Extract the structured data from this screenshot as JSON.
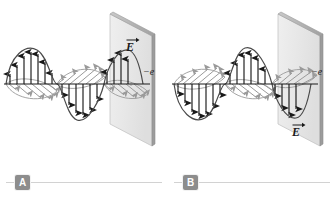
{
  "figure": {
    "background_color": "#ffffff",
    "width": 336,
    "height": 198
  },
  "colors": {
    "e_field_arrow": "#1a1a1a",
    "b_field_arrow": "#9a9a9a",
    "wave_envelope": "#4a4a4a",
    "axis": "#1a1a1a",
    "plate_face": "#e6e6e6",
    "plate_edge": "#a8a8a8",
    "plate_thickness": "#9c9c9c",
    "badge_bg": "#8d8d8d",
    "badge_text": "#ffffff",
    "caption_rule": "#d2d2d2"
  },
  "panels": [
    {
      "id": "A",
      "badge_label": "A",
      "e_vector_label": "E",
      "e_vector_direction": "up",
      "e_label_position": "above-axis",
      "charge_label": "−e",
      "polarization": "vertical",
      "wave": {
        "type": "sine",
        "cycles": 1.75,
        "first_lobe": "up",
        "e_arrow_count": 12,
        "b_arrow_count": 12
      },
      "plate": {
        "orientation": "perspective-right",
        "shape": "parallelogram"
      }
    },
    {
      "id": "B",
      "badge_label": "B",
      "e_vector_label": "E",
      "e_vector_direction": "down",
      "e_label_position": "below-axis",
      "charge_label": "−e",
      "polarization": "vertical",
      "wave": {
        "type": "sine",
        "cycles": 1.75,
        "first_lobe": "down",
        "e_arrow_count": 12,
        "b_arrow_count": 12
      },
      "plate": {
        "orientation": "perspective-right",
        "shape": "parallelogram"
      }
    }
  ]
}
